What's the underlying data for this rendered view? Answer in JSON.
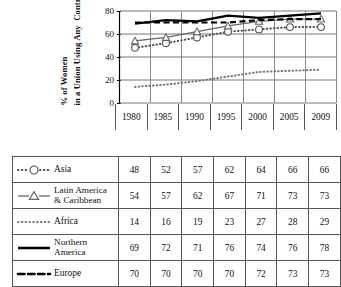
{
  "chart_data": {
    "type": "line",
    "title": "",
    "xlabel": "",
    "ylabel": "% of Women in a Union Using Any Contraceptive Method",
    "ylabel_line1": "% of Women",
    "ylabel_line2": "in a Union Using Any",
    "ylabel_line3": "Contraceptive Method",
    "categories": [
      "1980",
      "1985",
      "1990",
      "1995",
      "2000",
      "2005",
      "2009"
    ],
    "ylim": [
      0,
      80
    ],
    "yticks": [
      "0",
      "20",
      "40",
      "60",
      "80"
    ],
    "grid": true,
    "legend_position": "table-left-column",
    "series": [
      {
        "name": "Asia",
        "values": [
          48,
          52,
          57,
          62,
          64,
          66,
          66
        ],
        "marker": "open-circle",
        "line_style": "dotted",
        "color": "#555555"
      },
      {
        "name": "Latin America & Caribbean",
        "name_line1": "Latin America",
        "name_line2": "& Caribbean",
        "values": [
          54,
          57,
          62,
          67,
          71,
          73,
          73
        ],
        "marker": "open-triangle",
        "line_style": "solid",
        "color": "#666666"
      },
      {
        "name": "Africa",
        "values": [
          14,
          16,
          19,
          23,
          27,
          28,
          29
        ],
        "marker": "none",
        "line_style": "dotted",
        "color": "#777777"
      },
      {
        "name": "Northern America",
        "name_line1": "Northern",
        "name_line2": "America",
        "values": [
          69,
          72,
          71,
          76,
          74,
          76,
          78
        ],
        "marker": "none",
        "line_style": "solid-thick",
        "color": "#000000"
      },
      {
        "name": "Europe",
        "values": [
          70,
          70,
          70,
          70,
          72,
          73,
          73
        ],
        "marker": "none",
        "line_style": "dashed",
        "color": "#000000"
      }
    ]
  },
  "axis": {
    "y_title_line1": "% of Women",
    "y_title_line2": "in a Union Using Any",
    "y_title_line3": "Contraceptive Method",
    "y_title_rotated_1": "% of Women",
    "y_title_rotated_2": "in a Union Using Any  Contraceptive Method",
    "tick_80": "80",
    "tick_60": "60",
    "tick_40": "40",
    "tick_20": "20",
    "tick_0": "0"
  },
  "table": {
    "columns": [
      "1980",
      "1985",
      "1990",
      "1995",
      "2000",
      "2005",
      "2009"
    ],
    "rows": [
      {
        "label": "Asia",
        "label_line1": "Asia",
        "label_line2": "",
        "marker": "open-circle-dotted",
        "values": [
          "48",
          "52",
          "57",
          "62",
          "64",
          "66",
          "66"
        ]
      },
      {
        "label": "Latin America & Caribbean",
        "label_line1": "Latin America",
        "label_line2": "& Caribbean",
        "marker": "open-triangle-solid",
        "values": [
          "54",
          "57",
          "62",
          "67",
          "71",
          "73",
          "73"
        ]
      },
      {
        "label": "Africa",
        "label_line1": "Africa",
        "label_line2": "",
        "marker": "dotted",
        "values": [
          "14",
          "16",
          "19",
          "23",
          "27",
          "28",
          "29"
        ]
      },
      {
        "label": "Northern America",
        "label_line1": "Northern",
        "label_line2": "America",
        "marker": "solid-thick",
        "values": [
          "69",
          "72",
          "71",
          "76",
          "74",
          "76",
          "78"
        ]
      },
      {
        "label": "Europe",
        "label_line1": "Europe",
        "label_line2": "",
        "marker": "dashed",
        "values": [
          "70",
          "70",
          "70",
          "70",
          "72",
          "73",
          "73"
        ]
      }
    ]
  }
}
